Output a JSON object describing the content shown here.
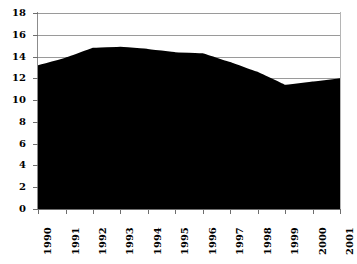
{
  "chart_data": {
    "type": "area",
    "title": "",
    "subtitle": "",
    "xlabel": "",
    "ylabel": "",
    "categories": [
      "1990",
      "1991",
      "1992",
      "1993",
      "1994",
      "1995",
      "1996",
      "1997",
      "1998",
      "1999",
      "2000",
      "2001"
    ],
    "values": [
      13.2,
      13.9,
      14.8,
      14.9,
      14.7,
      14.4,
      14.3,
      13.5,
      12.6,
      11.4,
      11.7,
      12.0
    ],
    "series": [
      {
        "name": "",
        "values": [
          13.2,
          13.9,
          14.8,
          14.9,
          14.7,
          14.4,
          14.3,
          13.5,
          12.6,
          11.4,
          11.7,
          12.0
        ]
      }
    ],
    "ylim": [
      0,
      18
    ],
    "ytick_step": 2,
    "yticks": [
      0,
      2,
      4,
      6,
      8,
      10,
      12,
      14,
      16,
      18
    ],
    "ytick_labels": [
      "0",
      "2",
      "4",
      "6",
      "8",
      "10",
      "12",
      "14",
      "16",
      "18"
    ],
    "xtick_labels": [
      "1990",
      "1991",
      "1992",
      "1993",
      "1994",
      "1995",
      "1996",
      "1997",
      "1998",
      "1999",
      "2000",
      "2001"
    ],
    "xtick_rotation": 90,
    "grid": true,
    "gridlines_visible": [
      16,
      18
    ],
    "legend": false,
    "legend_position": "none",
    "annotations": [],
    "colors": {
      "area_fill": "#000000",
      "background": "#ffffff",
      "gridline": "#9a9a9a",
      "axis": "#6e6e6e",
      "text": "#000000"
    }
  }
}
